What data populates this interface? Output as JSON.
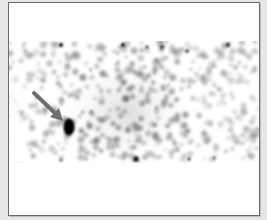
{
  "image": {
    "description": "Scintigraphy scan (grayscale nuclear medicine image) showing a horizontal band of speckled tracer uptake with a focal intense hot spot on the left indicated by a gray arrow.",
    "annotations": [
      {
        "type": "arrow",
        "color": "#6e6e6e",
        "points_to": "focal-hot-spot"
      }
    ],
    "findings": [
      {
        "name": "focal-hot-spot",
        "shape": "oval",
        "color": "#000000"
      }
    ],
    "colors": {
      "background": "#e6e6e6",
      "panel": "#ffffff",
      "border": "#6a6a6a",
      "arrow": "#6e6e6e",
      "hot_spot": "#000000"
    }
  }
}
